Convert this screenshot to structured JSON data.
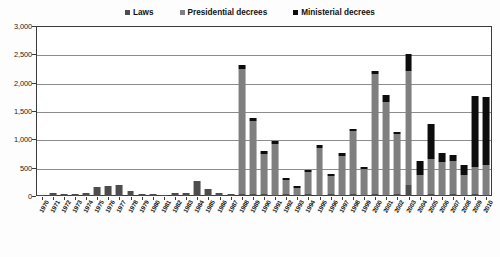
{
  "chart_data": {
    "type": "bar",
    "stacked": true,
    "title": "",
    "subtitle": "",
    "xlabel": "",
    "ylabel": "",
    "ylim": [
      0,
      3000
    ],
    "ytick_values": [
      0,
      500,
      1000,
      1500,
      2000,
      2500,
      3000
    ],
    "ytick_labels": [
      "0",
      "500",
      "1,000",
      "1,500",
      "2,000",
      "2,500",
      "3,000"
    ],
    "grid": true,
    "legend_position": "top-center",
    "categories": [
      "1970",
      "1971",
      "1972",
      "1973",
      "1974",
      "1975",
      "1976",
      "1977",
      "1978",
      "1979",
      "1980",
      "1981",
      "1982",
      "1983",
      "1984",
      "1985",
      "1986",
      "1987",
      "1988",
      "1989",
      "1990",
      "1991",
      "1992",
      "1993",
      "1994",
      "1995",
      "1996",
      "1997",
      "1998",
      "1999",
      "2000",
      "2001",
      "2002",
      "2003",
      "2004",
      "2005",
      "2006",
      "2007",
      "2008",
      "2009",
      "2010"
    ],
    "series": [
      {
        "name": "Laws",
        "color": "#4d4d4d",
        "values": [
          10,
          45,
          40,
          30,
          55,
          160,
          180,
          195,
          80,
          35,
          30,
          25,
          55,
          60,
          270,
          120,
          45,
          40,
          35,
          30,
          30,
          25,
          30,
          25,
          30,
          25,
          30,
          25,
          30,
          25,
          30,
          25,
          30,
          190,
          25,
          30,
          25,
          30,
          25,
          30,
          25
        ]
      },
      {
        "name": "Presidential decrees",
        "color": "#7f7f7f",
        "values": [
          0,
          0,
          0,
          0,
          0,
          0,
          0,
          0,
          0,
          0,
          0,
          0,
          0,
          0,
          0,
          0,
          0,
          0,
          2200,
          1290,
          720,
          900,
          250,
          120,
          390,
          830,
          320,
          690,
          1110,
          450,
          2120,
          1640,
          1060,
          2010,
          340,
          620,
          580,
          580,
          340,
          480,
          520
        ]
      },
      {
        "name": "Ministerial decrees",
        "color": "#0d0d0d",
        "values": [
          0,
          0,
          0,
          0,
          0,
          0,
          0,
          0,
          0,
          0,
          0,
          0,
          0,
          0,
          0,
          0,
          0,
          0,
          70,
          50,
          40,
          40,
          35,
          30,
          35,
          40,
          35,
          40,
          45,
          40,
          50,
          110,
          40,
          310,
          260,
          620,
          150,
          120,
          180,
          1260,
          1200
        ]
      }
    ],
    "legend": [
      {
        "label": "Laws",
        "color": "#4d4d4d"
      },
      {
        "label": "Presidential decrees",
        "color": "#7f7f7f"
      },
      {
        "label": "Ministerial decrees",
        "color": "#0d0d0d"
      }
    ]
  }
}
